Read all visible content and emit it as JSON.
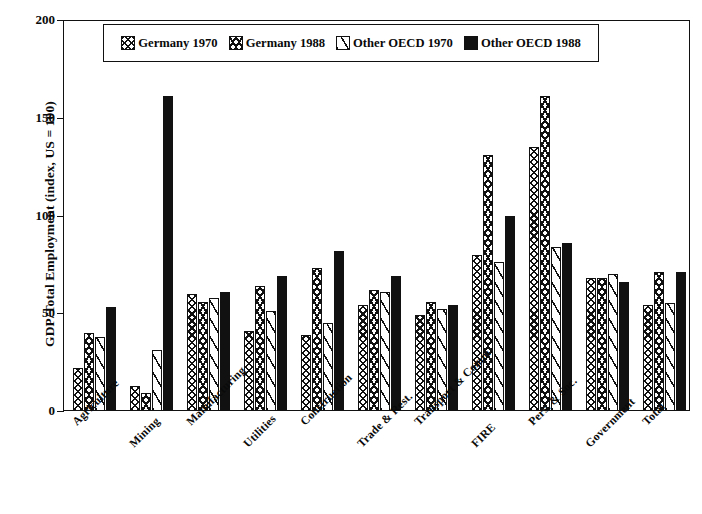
{
  "chart_data": {
    "type": "bar",
    "title": "",
    "xlabel": "",
    "ylabel": "GDP/Total Employment (index, US = 100)",
    "ylim": [
      0,
      200
    ],
    "yticks": [
      0,
      50,
      100,
      150,
      200
    ],
    "grid": false,
    "legend_position": "top-center",
    "categories": [
      "Agriculture",
      "Mining",
      "Manufacturing",
      "Utilities",
      "Construction",
      "Trade & Rest.",
      "Transport & Comm.",
      "FIRE",
      "Pers. & Soc.",
      "Government",
      "Total"
    ],
    "series": [
      {
        "name": "Germany 1970",
        "pattern": "cross-hatch",
        "values": [
          22,
          13,
          60,
          41,
          39,
          54,
          49,
          80,
          135,
          68,
          54
        ]
      },
      {
        "name": "Germany 1988",
        "pattern": "diagonal-hatch",
        "values": [
          40,
          9,
          56,
          64,
          73,
          62,
          56,
          131,
          161,
          68,
          71
        ]
      },
      {
        "name": "Other OECD 1970",
        "pattern": "sparse-hatch-white",
        "values": [
          38,
          31,
          58,
          51,
          45,
          61,
          52,
          76,
          84,
          70,
          55
        ]
      },
      {
        "name": "Other OECD 1988",
        "pattern": "solid-black",
        "values": [
          53,
          161,
          61,
          69,
          82,
          69,
          54,
          100,
          86,
          66,
          71
        ]
      }
    ]
  },
  "legend": {
    "items": [
      {
        "label": "Germany 1970"
      },
      {
        "label": "Germany 1988"
      },
      {
        "label": "Other OECD 1970"
      },
      {
        "label": "Other OECD 1988"
      }
    ]
  },
  "axis": {
    "y_title": "GDP/Total Employment (index, US = 100)",
    "y_tick_labels": [
      "200",
      "150",
      "100",
      "50",
      "0"
    ]
  }
}
